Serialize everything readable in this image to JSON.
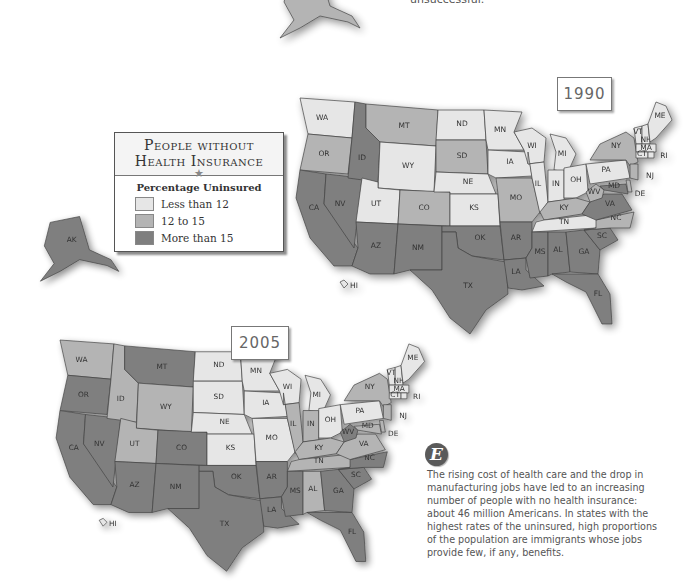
{
  "top_text": "unsuccessful.",
  "legend": {
    "title_line1": "People without",
    "title_line2": "Health Insurance",
    "star": "★",
    "subtitle": "Percentage Uninsured",
    "items": [
      {
        "label": "Less than 12",
        "color": "#e6e6e6",
        "key": "low"
      },
      {
        "label": "12 to 15",
        "color": "#b4b4b4",
        "key": "mid"
      },
      {
        "label": "More than 15",
        "color": "#7f7f7f",
        "key": "high"
      }
    ]
  },
  "maps": [
    {
      "year": "1990",
      "states": {
        "AK": "mid",
        "HI": "low",
        "WA": "low",
        "OR": "mid",
        "CA": "high",
        "NV": "high",
        "ID": "high",
        "MT": "mid",
        "WY": "low",
        "UT": "low",
        "CO": "mid",
        "AZ": "high",
        "NM": "high",
        "ND": "low",
        "SD": "mid",
        "NE": "low",
        "KS": "low",
        "OK": "high",
        "TX": "high",
        "MN": "low",
        "IA": "low",
        "MO": "mid",
        "AR": "high",
        "LA": "high",
        "WI": "low",
        "IL": "low",
        "MI": "low",
        "IN": "low",
        "OH": "low",
        "KY": "mid",
        "TN": "low",
        "MS": "high",
        "AL": "high",
        "GA": "high",
        "FL": "high",
        "SC": "high",
        "NC": "mid",
        "VA": "high",
        "WV": "mid",
        "MD": "high",
        "DE": "mid",
        "PA": "low",
        "NY": "mid",
        "NJ": "mid",
        "VT": "low",
        "NH": "low",
        "MA": "low",
        "CT": "low",
        "RI": "low",
        "ME": "low"
      }
    },
    {
      "year": "2005",
      "states": {
        "AK": "high",
        "HI": "low",
        "WA": "mid",
        "OR": "high",
        "CA": "high",
        "NV": "high",
        "ID": "mid",
        "MT": "high",
        "WY": "mid",
        "UT": "mid",
        "CO": "high",
        "AZ": "high",
        "NM": "high",
        "ND": "low",
        "SD": "low",
        "NE": "low",
        "KS": "low",
        "OK": "high",
        "TX": "high",
        "MN": "low",
        "IA": "low",
        "MO": "low",
        "AR": "high",
        "LA": "high",
        "WI": "low",
        "IL": "mid",
        "MI": "low",
        "IN": "mid",
        "OH": "low",
        "KY": "mid",
        "TN": "mid",
        "MS": "high",
        "AL": "mid",
        "GA": "high",
        "FL": "high",
        "SC": "high",
        "NC": "high",
        "VA": "mid",
        "WV": "high",
        "MD": "mid",
        "DE": "mid",
        "PA": "low",
        "NY": "mid",
        "NJ": "mid",
        "VT": "low",
        "NH": "low",
        "MA": "low",
        "CT": "low",
        "RI": "low",
        "ME": "low"
      }
    }
  ],
  "caption_badge": "E",
  "caption": "The rising cost of health care and the drop in manufacturing jobs have led to an increasing number of people with no health insurance: about 46 million Americans. In states with the highest rates of the uninsured, high proportions of the population are immigrants whose jobs provide few, if any, benefits.",
  "colors": {
    "low": "#e6e6e6",
    "mid": "#b4b4b4",
    "high": "#7f7f7f",
    "stroke": "#444444"
  }
}
